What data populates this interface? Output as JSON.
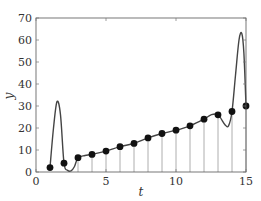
{
  "chart_data": {
    "type": "line",
    "title": "",
    "xlabel": "t",
    "ylabel": "y",
    "xlim": [
      0,
      15
    ],
    "ylim": [
      0,
      70
    ],
    "xticks": [
      0,
      5,
      10,
      15
    ],
    "yticks": [
      0,
      10,
      20,
      30,
      40,
      50,
      60,
      70
    ],
    "grid": false,
    "legend": null,
    "series": [
      {
        "name": "samples",
        "style": "markers with stems",
        "x": [
          1,
          2,
          3,
          4,
          5,
          6,
          7,
          8,
          9,
          10,
          11,
          12,
          13,
          14,
          15
        ],
        "values": [
          2,
          4,
          6.5,
          8,
          9.5,
          11.5,
          13,
          15.5,
          17.5,
          19,
          21,
          24,
          26,
          27.5,
          30
        ],
        "stem_from_index": 2
      },
      {
        "name": "interpolant",
        "style": "smooth curve",
        "x": [
          1,
          1.25,
          1.5,
          1.75,
          2,
          2.25,
          2.5,
          2.75,
          3,
          3.5,
          4,
          5,
          6,
          7,
          8,
          9,
          10,
          11,
          12,
          12.5,
          13,
          13.5,
          13.75,
          14,
          14.25,
          14.5,
          14.7,
          14.85,
          15
        ],
        "values": [
          2,
          20,
          32,
          26,
          4,
          0.8,
          0.5,
          2.5,
          6.5,
          7.5,
          8,
          9.5,
          11.5,
          13,
          15.5,
          17.5,
          19,
          21,
          24,
          26,
          26,
          21.5,
          21,
          27.5,
          44,
          60,
          63,
          54,
          30
        ]
      }
    ]
  }
}
